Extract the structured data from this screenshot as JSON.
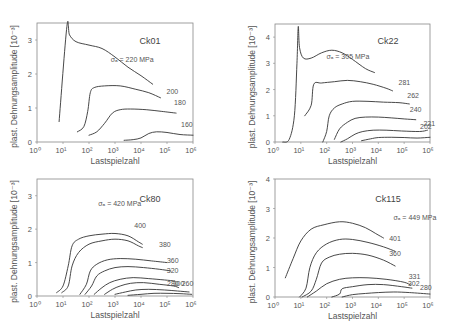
{
  "figure": {
    "xlabel": "Lastspielzahl",
    "ylabel": "plast. Dehnungsamplitude [10⁻³]"
  },
  "chart_data": [
    {
      "type": "line",
      "title": "Ck01",
      "xlabel": "Lastspielzahl",
      "ylabel": "plast. Dehnungsamplitude [10⁻³]",
      "xscale": "log",
      "xlim_log10": [
        0,
        6
      ],
      "ylim": [
        0,
        3.5
      ],
      "xticks": [
        "10⁰",
        "10¹",
        "10²",
        "10³",
        "10⁴",
        "10⁵",
        "10⁶"
      ],
      "yticks": [
        0,
        1,
        2,
        3
      ],
      "series": [
        {
          "name": "σa = 220 MPa",
          "label": "σₐ = 220 MPa",
          "log10N": [
            0.85,
            1.15,
            1.25,
            1.5,
            2.0,
            2.5,
            3.0,
            3.5,
            4.0,
            4.45
          ],
          "values": [
            0.6,
            3.4,
            3.15,
            2.95,
            2.85,
            2.75,
            2.5,
            2.2,
            1.95,
            1.7
          ]
        },
        {
          "name": "200",
          "label": "200",
          "log10N": [
            1.55,
            1.8,
            1.95,
            2.05,
            2.2,
            2.6,
            3.2,
            3.8,
            4.3,
            4.75
          ],
          "values": [
            0.3,
            0.45,
            0.9,
            1.45,
            1.6,
            1.65,
            1.65,
            1.55,
            1.45,
            1.3
          ]
        },
        {
          "name": "180",
          "label": "180",
          "log10N": [
            2.0,
            2.3,
            2.6,
            2.9,
            3.2,
            3.6,
            4.2,
            4.8,
            5.35
          ],
          "values": [
            0.2,
            0.3,
            0.55,
            0.85,
            0.95,
            0.97,
            0.95,
            0.9,
            0.85
          ]
        },
        {
          "name": "160",
          "label": "160",
          "log10N": [
            3.35,
            3.7,
            4.0,
            4.3,
            4.6,
            5.0,
            5.5,
            6.0
          ],
          "values": [
            0.05,
            0.07,
            0.12,
            0.25,
            0.3,
            0.28,
            0.22,
            0.2
          ]
        }
      ]
    },
    {
      "type": "line",
      "title": "Ck22",
      "xlabel": "Lastspielzahl",
      "ylabel": "plast. Dehnungsamplitude [10⁻³]",
      "xscale": "log",
      "xlim_log10": [
        0,
        6
      ],
      "ylim": [
        0,
        4.5
      ],
      "xticks": [
        "10⁰",
        "10¹",
        "10²",
        "10³",
        "10⁴",
        "10⁵",
        "10⁶"
      ],
      "yticks": [
        0,
        1,
        2,
        3,
        4
      ],
      "series": [
        {
          "name": "σa = 305 MPa",
          "label": "σₐ = 305 MPa",
          "log10N": [
            0.3,
            0.55,
            0.75,
            0.85,
            0.9,
            0.95,
            1.1,
            1.4,
            1.8,
            2.2,
            2.6,
            3.0,
            3.5,
            3.85
          ],
          "values": [
            0.0,
            0.1,
            1.0,
            3.0,
            4.4,
            3.6,
            3.2,
            3.2,
            3.4,
            3.5,
            3.4,
            3.15,
            2.8,
            2.65
          ]
        },
        {
          "name": "281",
          "label": "281",
          "log10N": [
            1.15,
            1.4,
            1.5,
            1.8,
            2.3,
            2.8,
            3.3,
            3.8,
            4.3,
            4.55
          ],
          "values": [
            1.0,
            1.4,
            2.2,
            2.25,
            2.3,
            2.35,
            2.3,
            2.2,
            2.05,
            1.95
          ]
        },
        {
          "name": "262",
          "label": "262",
          "log10N": [
            1.85,
            2.0,
            2.1,
            2.3,
            2.6,
            3.0,
            3.6,
            4.2,
            4.8,
            5.2
          ],
          "values": [
            0.0,
            0.4,
            1.0,
            1.3,
            1.45,
            1.55,
            1.55,
            1.52,
            1.5,
            1.45
          ]
        },
        {
          "name": "240",
          "label": "240",
          "log10N": [
            2.3,
            2.5,
            2.8,
            3.1,
            3.5,
            4.0,
            4.5,
            5.0,
            5.45
          ],
          "values": [
            0.1,
            0.5,
            0.75,
            0.9,
            0.95,
            0.95,
            0.92,
            0.88,
            0.85
          ]
        },
        {
          "name": "221",
          "label": "221",
          "log10N": [
            2.55,
            2.8,
            3.1,
            3.4,
            3.8,
            4.3,
            4.9,
            5.6,
            5.9
          ],
          "values": [
            0.0,
            0.12,
            0.3,
            0.4,
            0.45,
            0.45,
            0.42,
            0.4,
            0.45
          ]
        },
        {
          "name": "202",
          "label": "202",
          "log10N": [
            3.35,
            3.7,
            4.0,
            4.5,
            5.0,
            5.5,
            6.0
          ],
          "values": [
            0.05,
            0.12,
            0.17,
            0.18,
            0.17,
            0.15,
            0.18
          ]
        }
      ]
    },
    {
      "type": "line",
      "title": "Ck80",
      "xlabel": "Lastspielzahl",
      "ylabel": "plast. Dehnungsamplitude [10⁻³]",
      "xscale": "log",
      "xlim_log10": [
        0,
        6
      ],
      "ylim": [
        0,
        3.5
      ],
      "xticks": [
        "10⁰",
        "10¹",
        "10²",
        "10³",
        "10⁴",
        "10⁵",
        "10⁶"
      ],
      "yticks": [
        0,
        1,
        2,
        3
      ],
      "series": [
        {
          "name": "σa = 420 MPa",
          "label": "σₐ = 420 MPa",
          "log10N": [
            0.75,
            1.0,
            1.2,
            1.35,
            1.6,
            2.0,
            2.5,
            3.0,
            3.5,
            3.9,
            4.05
          ],
          "values": [
            0.1,
            0.3,
            0.9,
            1.5,
            1.7,
            1.8,
            1.85,
            1.87,
            1.8,
            1.62,
            1.55
          ]
        },
        {
          "name": "400",
          "label": "400",
          "log10N": [
            0.95,
            1.2,
            1.35,
            1.6,
            2.0,
            2.5,
            3.0,
            3.5,
            3.9,
            4.05
          ],
          "values": [
            0.1,
            0.3,
            0.9,
            1.3,
            1.55,
            1.65,
            1.7,
            1.65,
            1.5,
            1.45
          ]
        },
        {
          "name": "380",
          "label": "380",
          "log10N": [
            1.65,
            1.9,
            2.05,
            2.3,
            2.7,
            3.2,
            3.8,
            4.4,
            5.0
          ],
          "values": [
            0.05,
            0.35,
            0.75,
            0.95,
            1.08,
            1.12,
            1.1,
            1.05,
            1.0
          ]
        },
        {
          "name": "360",
          "label": "360",
          "log10N": [
            1.85,
            2.1,
            2.3,
            2.6,
            3.0,
            3.5,
            4.1,
            4.7,
            5.15
          ],
          "values": [
            0.05,
            0.3,
            0.6,
            0.75,
            0.85,
            0.88,
            0.85,
            0.8,
            0.75
          ]
        },
        {
          "name": "320",
          "label": "320",
          "log10N": [
            2.2,
            2.5,
            2.8,
            3.2,
            3.7,
            4.3,
            4.9,
            5.3
          ],
          "values": [
            0.05,
            0.25,
            0.4,
            0.5,
            0.55,
            0.52,
            0.48,
            0.45
          ]
        },
        {
          "name": "300",
          "label": "300",
          "log10N": [
            2.6,
            2.9,
            3.2,
            3.6,
            4.1,
            4.7,
            5.25,
            5.45
          ],
          "values": [
            0.05,
            0.2,
            0.3,
            0.38,
            0.4,
            0.35,
            0.3,
            0.25
          ]
        },
        {
          "name": "280",
          "label": "280",
          "log10N": [
            3.0,
            3.4,
            3.8,
            4.3,
            4.9,
            5.4,
            5.85
          ],
          "values": [
            0.05,
            0.12,
            0.18,
            0.2,
            0.18,
            0.15,
            0.12
          ]
        },
        {
          "name": "260",
          "label": "260",
          "log10N": [
            3.5,
            4.0,
            4.5,
            5.0,
            5.5,
            5.95
          ],
          "values": [
            0.02,
            0.05,
            0.08,
            0.08,
            0.07,
            0.05
          ]
        }
      ]
    },
    {
      "type": "line",
      "title": "Ck115",
      "xlabel": "Lastspielzahl",
      "ylabel": "plast. Dehnungsamplitude [10⁻³]",
      "xscale": "log",
      "xlim_log10": [
        0,
        6
      ],
      "ylim": [
        0,
        4
      ],
      "xticks": [
        "10⁰",
        "10¹",
        "10²",
        "10³",
        "10⁴",
        "10⁵",
        "10⁶"
      ],
      "yticks": [
        0,
        1,
        2,
        3,
        4
      ],
      "series": [
        {
          "name": "σa = 449 MPa",
          "label": "σₐ = 449 MPa",
          "log10N": [
            0.4,
            0.7,
            1.0,
            1.4,
            1.9,
            2.5,
            3.0,
            3.5,
            3.9,
            4.2
          ],
          "values": [
            0.65,
            1.3,
            1.9,
            2.3,
            2.45,
            2.55,
            2.5,
            2.35,
            2.15,
            2.0
          ]
        },
        {
          "name": "401",
          "label": "401",
          "log10N": [
            0.95,
            1.2,
            1.35,
            1.6,
            2.0,
            2.5,
            3.0,
            3.6,
            4.2,
            4.65
          ],
          "values": [
            0.0,
            0.3,
            1.0,
            1.5,
            1.8,
            1.95,
            1.95,
            1.85,
            1.7,
            1.55
          ]
        },
        {
          "name": "360",
          "label": "360",
          "log10N": [
            1.05,
            1.4,
            1.6,
            1.8,
            2.1,
            2.5,
            3.0,
            3.6,
            4.2,
            4.65
          ],
          "values": [
            0.0,
            0.2,
            0.6,
            1.15,
            1.35,
            1.45,
            1.48,
            1.42,
            1.25,
            1.05
          ]
        },
        {
          "name": "331",
          "label": "331",
          "log10N": [
            1.25,
            1.6,
            2.0,
            2.5,
            3.0,
            3.6,
            4.3,
            5.0,
            5.25
          ],
          "values": [
            0.0,
            0.2,
            0.45,
            0.6,
            0.65,
            0.65,
            0.6,
            0.5,
            0.4
          ]
        },
        {
          "name": "302",
          "label": "302",
          "log10N": [
            2.2,
            2.5,
            2.6,
            3.0,
            3.6,
            4.2,
            4.9,
            5.3
          ],
          "values": [
            0.0,
            0.1,
            0.28,
            0.35,
            0.42,
            0.42,
            0.35,
            0.3
          ]
        },
        {
          "name": "280",
          "label": "280",
          "log10N": [
            2.6,
            3.0,
            3.5,
            4.0,
            4.6,
            5.2,
            6.0
          ],
          "values": [
            0.0,
            0.08,
            0.12,
            0.15,
            0.17,
            0.15,
            0.1
          ]
        }
      ]
    }
  ]
}
